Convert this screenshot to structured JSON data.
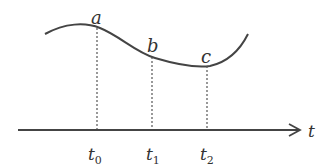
{
  "diagram": {
    "axis_label": "t",
    "points": [
      {
        "label": "a",
        "time_label": "t",
        "time_sub": "0"
      },
      {
        "label": "b",
        "time_label": "t",
        "time_sub": "1"
      },
      {
        "label": "c",
        "time_label": "t",
        "time_sub": "2"
      }
    ],
    "colors": {
      "stroke": "#444444",
      "text": "#333333"
    }
  }
}
